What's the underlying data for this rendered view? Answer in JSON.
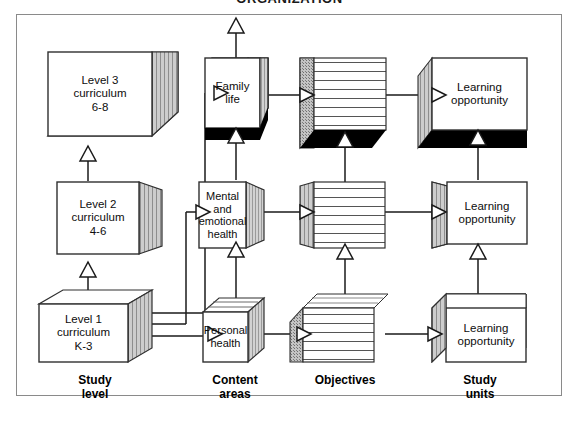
{
  "heading": "ORGANIZATION",
  "columns": [
    {
      "key": "study_level",
      "caption": "Study\nlevel"
    },
    {
      "key": "content_areas",
      "caption": "Content\nareas"
    },
    {
      "key": "objectives",
      "caption": "Objectives"
    },
    {
      "key": "study_units",
      "caption": "Study\nunits"
    }
  ],
  "study_level": {
    "boxes": [
      {
        "id": "level3",
        "text": "Level 3\ncurriculum\n6-8"
      },
      {
        "id": "level2",
        "text": "Level 2\ncurriculum\n4-6"
      },
      {
        "id": "level1",
        "text": "Level 1\ncurriculum\nK-3"
      }
    ]
  },
  "content_areas": {
    "boxes": [
      {
        "id": "family_life",
        "text": "Family\nlife"
      },
      {
        "id": "mental_emotional",
        "text": "Mental\nand\nemotional\nhealth"
      },
      {
        "id": "personal_health",
        "text": "Personal\nhealth"
      }
    ]
  },
  "objectives": {
    "boxes": [
      {
        "id": "objectives_top",
        "text": ""
      },
      {
        "id": "objectives_middle",
        "text": ""
      },
      {
        "id": "objectives_bottom",
        "text": ""
      }
    ]
  },
  "study_units": {
    "boxes": [
      {
        "id": "learning_opportunity_top",
        "text": "Learning\nopportunity"
      },
      {
        "id": "learning_opportunity_middle",
        "text": "Learning\nopportunity"
      },
      {
        "id": "learning_opportunity_bottom",
        "text": "Learning\nopportunity"
      }
    ]
  },
  "colors": {
    "frame_border": "#8a8a8a",
    "box_stroke": "#3a3a3a",
    "shade_face": "#c9c9c9",
    "dark_face": "#000000",
    "background": "#ffffff",
    "connector": "#1a1a1a"
  }
}
